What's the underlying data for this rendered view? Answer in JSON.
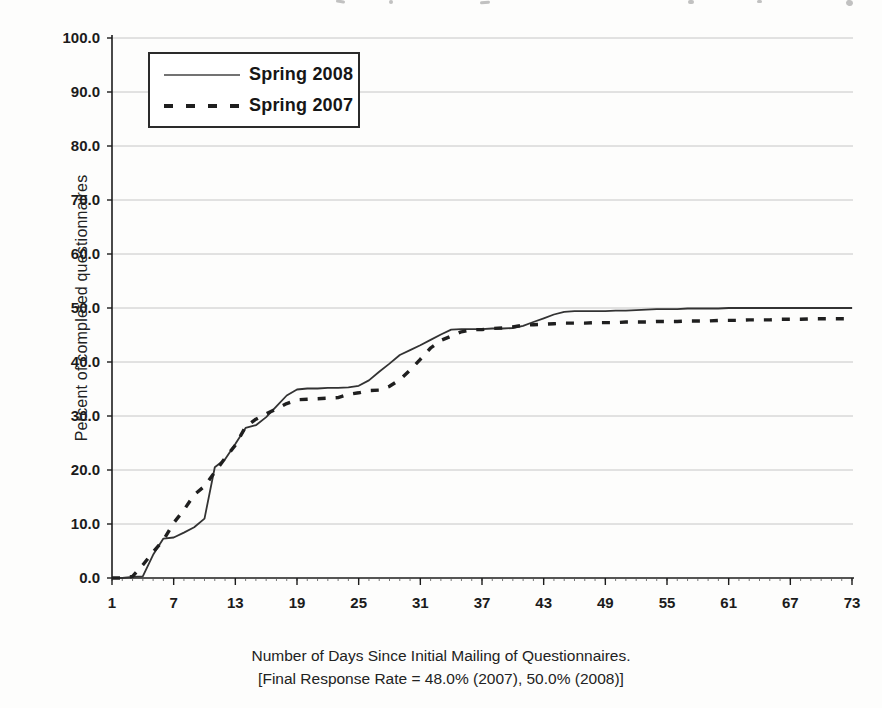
{
  "figure": {
    "y_axis_title": "Percent of completed questionnaires",
    "caption_line1": "Number of Days Since Initial Mailing of Questionnaires.",
    "caption_line2": "[Final Response Rate = 48.0% (2007), 50.0% (2008)]"
  },
  "legend": {
    "items": [
      {
        "label": "Spring 2008",
        "style": "solid"
      },
      {
        "label": "Spring 2007",
        "style": "dashed"
      }
    ]
  },
  "colors": {
    "solid_line": "#333333",
    "dashed_line": "#1f1f1f",
    "gridline": "#c6c6c6",
    "axis": "#1c1c1c",
    "text": "#1b1b1b"
  },
  "chart_data": {
    "type": "line",
    "title": "",
    "xlabel": "Number of Days Since Initial Mailing of Questionnaires.",
    "ylabel": "Percent of completed questionnaires",
    "xlim": [
      1,
      73
    ],
    "ylim": [
      0,
      100
    ],
    "grid": "horizontal",
    "legend_position": "top-left-inside",
    "x_ticks": [
      1,
      7,
      13,
      19,
      25,
      31,
      37,
      43,
      49,
      55,
      61,
      67,
      73
    ],
    "y_ticks": [
      0,
      10,
      20,
      30,
      40,
      50,
      60,
      70,
      80,
      90,
      100
    ],
    "y_tick_labels": [
      "0.0",
      "10.0",
      "20.0",
      "30.0",
      "40.0",
      "50.0",
      "60.0",
      "70.0",
      "80.0",
      "90.0",
      "100.0"
    ],
    "x_unit_days_first": 1,
    "x_unit_days_last": 73,
    "series": [
      {
        "name": "Spring 2008",
        "style": "solid",
        "final_response_rate": "50.0%",
        "values": [
          0.0,
          0.0,
          0.2,
          0.3,
          4.3,
          7.3,
          7.5,
          8.4,
          9.4,
          11.0,
          20.5,
          22.0,
          24.8,
          27.8,
          28.3,
          29.8,
          31.8,
          33.8,
          34.9,
          35.1,
          35.1,
          35.2,
          35.2,
          35.3,
          35.6,
          36.6,
          38.2,
          39.7,
          41.3,
          42.2,
          43.1,
          44.1,
          45.1,
          46.0,
          46.1,
          46.1,
          46.1,
          46.2,
          46.2,
          46.3,
          46.7,
          47.4,
          48.1,
          48.8,
          49.3,
          49.4,
          49.4,
          49.4,
          49.4,
          49.5,
          49.5,
          49.6,
          49.7,
          49.8,
          49.8,
          49.8,
          49.9,
          49.9,
          49.9,
          49.9,
          50.0,
          50.0,
          50.0,
          50.0,
          50.0,
          50.0,
          50.0,
          50.0,
          50.0,
          50.0,
          50.0,
          50.0,
          50.0
        ]
      },
      {
        "name": "Spring 2007",
        "style": "dashed",
        "final_response_rate": "48.0%",
        "values": [
          0.0,
          0.0,
          0.3,
          2.4,
          4.8,
          7.0,
          10.2,
          12.6,
          15.4,
          17.0,
          19.6,
          22.2,
          24.6,
          28.0,
          29.4,
          30.4,
          31.3,
          32.3,
          33.0,
          33.1,
          33.2,
          33.3,
          33.4,
          34.0,
          34.3,
          34.7,
          34.8,
          35.5,
          36.7,
          38.5,
          40.5,
          42.6,
          44.0,
          44.8,
          45.6,
          46.0,
          46.0,
          46.2,
          46.3,
          46.5,
          46.8,
          46.9,
          47.0,
          47.1,
          47.2,
          47.2,
          47.2,
          47.3,
          47.3,
          47.3,
          47.4,
          47.4,
          47.4,
          47.5,
          47.5,
          47.5,
          47.6,
          47.6,
          47.6,
          47.7,
          47.7,
          47.7,
          47.8,
          47.8,
          47.8,
          47.9,
          47.9,
          47.9,
          48.0,
          48.0,
          48.0,
          48.0,
          48.0
        ]
      }
    ]
  }
}
